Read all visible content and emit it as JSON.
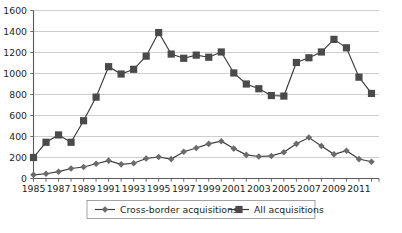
{
  "chart_data": {
    "type": "line",
    "title": "",
    "subtitle": "",
    "xlabel": "",
    "ylabel": "",
    "ylim": [
      0,
      1600
    ],
    "ytick_step": 200,
    "yticks": [
      0,
      200,
      400,
      600,
      800,
      1000,
      1200,
      1400,
      1600
    ],
    "grid": true,
    "grid_axis": "y",
    "legend_position": "bottom-center",
    "x": [
      1985,
      1986,
      1987,
      1988,
      1989,
      1990,
      1991,
      1992,
      1993,
      1994,
      1995,
      1996,
      1997,
      1998,
      1999,
      2000,
      2001,
      2002,
      2003,
      2004,
      2005,
      2006,
      2007,
      2008,
      2009,
      2010,
      2011,
      2012
    ],
    "xticklabels": [
      "1985",
      "",
      "1987",
      "",
      "1989",
      "",
      "1991",
      "",
      "1993",
      "",
      "1995",
      "",
      "1997",
      "",
      "1999",
      "",
      "2001",
      "",
      "2003",
      "",
      "2005",
      "",
      "2007",
      "",
      "2009",
      "",
      "2011",
      ""
    ],
    "xtick_labeled_years": [
      "1985",
      "1987",
      "1989",
      "1991",
      "1993",
      "1995",
      "1997",
      "1999",
      "2001",
      "2003",
      "2005",
      "2007",
      "2009",
      "2011"
    ],
    "series": [
      {
        "name": "Cross-border acquisitions",
        "marker": "diamond",
        "color": "#6b6b6b",
        "values": [
          35,
          45,
          65,
          95,
          110,
          140,
          170,
          135,
          145,
          190,
          205,
          185,
          255,
          290,
          330,
          355,
          285,
          225,
          210,
          215,
          250,
          330,
          390,
          310,
          230,
          265,
          185,
          160
        ]
      },
      {
        "name": "All acquisitions",
        "marker": "square",
        "color": "#4a4a4a",
        "values": [
          200,
          345,
          415,
          345,
          550,
          775,
          1065,
          995,
          1040,
          1165,
          1390,
          1185,
          1145,
          1175,
          1155,
          1205,
          1005,
          900,
          855,
          790,
          785,
          1105,
          1150,
          1205,
          1325,
          1245,
          965,
          810
        ]
      }
    ],
    "legend": [
      {
        "label": "Cross-border acquisitions",
        "marker": "diamond"
      },
      {
        "label": "All acquisitions",
        "marker": "square"
      }
    ]
  }
}
